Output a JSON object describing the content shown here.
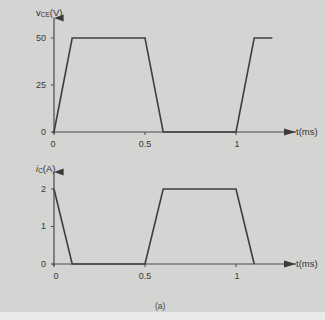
{
  "figure": {
    "caption": "(a)"
  },
  "chart_data": [
    {
      "type": "line",
      "title": "",
      "ylabel": "vCE(V)",
      "ylabel_main": "v",
      "ylabel_sub": "CE",
      "ylabel_unit": "(V)",
      "xlabel": "t(ms)",
      "x": [
        0,
        0.1,
        0.5,
        0.6,
        1.0,
        1.1,
        1.2
      ],
      "y": [
        0,
        50,
        50,
        0,
        0,
        50,
        50
      ],
      "xticks": [
        "0",
        "0.5",
        "1"
      ],
      "xtick_values": [
        0,
        0.5,
        1
      ],
      "yticks": [
        "0",
        "25",
        "50"
      ],
      "ytick_values": [
        0,
        25,
        50
      ],
      "xlim": [
        0,
        1.2
      ],
      "ylim": [
        0,
        55
      ],
      "grid": false,
      "legend": null
    },
    {
      "type": "line",
      "title": "",
      "ylabel": "iC(A)",
      "ylabel_main": "i",
      "ylabel_sub": "C",
      "ylabel_unit": "(A)",
      "xlabel": "t(ms)",
      "x": [
        0,
        0.1,
        0.5,
        0.6,
        1.0,
        1.1
      ],
      "y": [
        2,
        0,
        0,
        2,
        2,
        0
      ],
      "xticks": [
        "0",
        "0.5",
        "1"
      ],
      "xtick_values": [
        0,
        0.5,
        1
      ],
      "yticks": [
        "0",
        "1",
        "2"
      ],
      "ytick_values": [
        0,
        1,
        2
      ],
      "xlim": [
        0,
        1.2
      ],
      "ylim": [
        0,
        2.3
      ],
      "grid": false,
      "legend": null
    }
  ]
}
